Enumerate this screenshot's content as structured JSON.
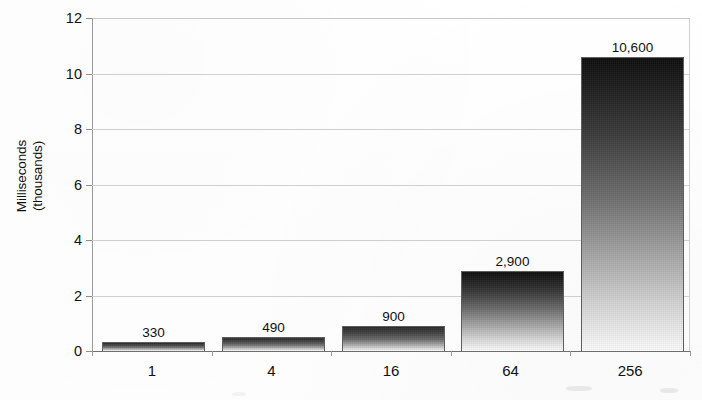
{
  "chart_data": {
    "type": "bar",
    "title": "",
    "subtitle": "",
    "xlabel": "",
    "ylabel": "Milliseconds (thousands)",
    "ylabel_lines": [
      "Milliseconds",
      "(thousands)"
    ],
    "categories": [
      "1",
      "4",
      "16",
      "64",
      "256"
    ],
    "values": [
      0.33,
      0.49,
      0.9,
      2.9,
      10.6
    ],
    "data_labels": [
      "330",
      "490",
      "900",
      "2,900",
      "10,600"
    ],
    "value_units": "milliseconds",
    "values_raw_ms": [
      330,
      490,
      900,
      2900,
      10600
    ],
    "ylim": [
      0,
      12
    ],
    "y_ticks": [
      0,
      2,
      4,
      6,
      8,
      10,
      12
    ],
    "y_tick_labels": [
      "0",
      "2",
      "4",
      "6",
      "8",
      "10",
      "12"
    ],
    "grid": true,
    "grid_axis": "y",
    "legend": false,
    "legend_position": "none",
    "bar_fill": "vertical-gradient-dark-to-light",
    "colors": {
      "bar_top": "#0d0d0d",
      "bar_bottom": "#fbfbfb",
      "bar_border": "#5d5d5d",
      "gridline": "#cfcfcf",
      "axis": "#6e6e6e",
      "text": "#111111",
      "background": "#ffffff"
    }
  }
}
